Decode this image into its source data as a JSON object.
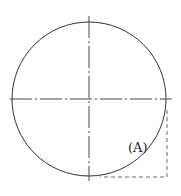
{
  "diagram": {
    "title": "",
    "circle": {
      "cx": 89,
      "cy": 99,
      "r": 77,
      "stroke": "#333333"
    },
    "centerlines": {
      "horizontal": {
        "x1": 10,
        "x2": 172,
        "y": 99
      },
      "vertical": {
        "x": 89,
        "y1": 16,
        "y2": 181
      },
      "stroke": "#444444"
    },
    "dashed_corner": {
      "x_right": 167,
      "y_top": 110,
      "y_bottom": 177,
      "x_left": 100,
      "stroke": "#666666"
    },
    "labels": {
      "region_a": "(A)"
    }
  }
}
